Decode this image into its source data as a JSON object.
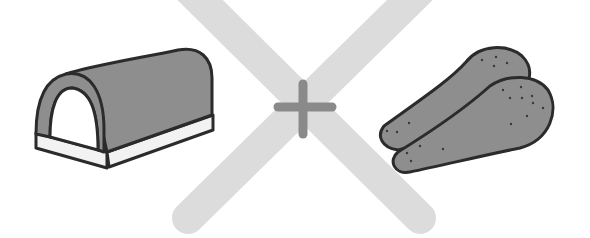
{
  "illustration": {
    "description": "Equation-style illustration: bread loaf shape plus two chicken drumsticks, crossed out with a large X",
    "left_item": {
      "label": "loaf"
    },
    "operator": {
      "symbol": "+"
    },
    "right_item": {
      "label": "drumsticks"
    },
    "cross_mark": {
      "symbol": "X"
    }
  },
  "colors": {
    "background": "#ffffff",
    "cross": "#dcdcdc",
    "plus": "#8a8a8a",
    "fill_dark": "#8e8e8e",
    "fill_light": "#f2f2f2",
    "outline": "#2b2b2b",
    "speckle": "#3a3a3a"
  }
}
